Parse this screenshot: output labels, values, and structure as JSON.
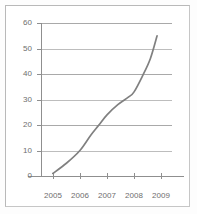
{
  "chart_data": {
    "type": "line",
    "title": "",
    "subtitle": "",
    "xlabel": "",
    "ylabel": "",
    "x": [
      2005,
      2006,
      2007,
      2008,
      2009
    ],
    "categories": [
      "2005",
      "2006",
      "2007",
      "2008",
      "2009"
    ],
    "series": [
      {
        "name": "series-1",
        "values": [
          1,
          10,
          24,
          33,
          55
        ],
        "color": "#808080"
      }
    ],
    "points": [
      {
        "x": 2005.0,
        "y": 1
      },
      {
        "x": 2005.5,
        "y": 5
      },
      {
        "x": 2006.0,
        "y": 10
      },
      {
        "x": 2006.4,
        "y": 16
      },
      {
        "x": 2006.7,
        "y": 20
      },
      {
        "x": 2007.0,
        "y": 24
      },
      {
        "x": 2007.4,
        "y": 28
      },
      {
        "x": 2007.8,
        "y": 31
      },
      {
        "x": 2008.0,
        "y": 33
      },
      {
        "x": 2008.3,
        "y": 39
      },
      {
        "x": 2008.6,
        "y": 46
      },
      {
        "x": 2008.85,
        "y": 55
      }
    ],
    "ylim": [
      0,
      60
    ],
    "xlim": [
      2004.6,
      2009.4
    ],
    "ytick_labels": [
      "0",
      "10",
      "20",
      "30",
      "40",
      "50",
      "60"
    ],
    "ytick_values": [
      0,
      10,
      20,
      30,
      40,
      50,
      60
    ],
    "xtick_labels": [
      "2005",
      "2006",
      "2007",
      "2008",
      "2009"
    ],
    "grid": true,
    "grid_axis": "y",
    "legend": false,
    "legend_position": "none",
    "colors": {
      "line": "#808080",
      "gridline": "#a9a9a9",
      "axis": "#8f8f8f",
      "tick_text": "#6e6e6e",
      "frame": "#b9b9b9",
      "background": "#ffffff"
    }
  }
}
